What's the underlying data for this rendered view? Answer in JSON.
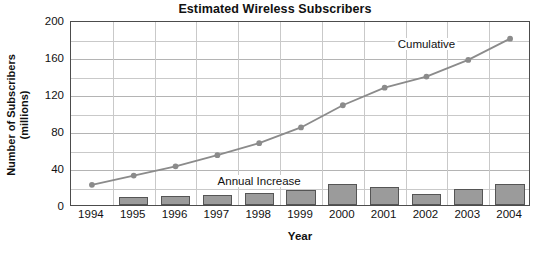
{
  "chart_data": {
    "type": "bar",
    "title": "Estimated Wireless Subscribers",
    "xlabel": "Year",
    "ylabel": "Number of Subscribers\n(millions)",
    "ylabel_line1": "Number of Subscribers",
    "ylabel_line2": "(millions)",
    "categories": [
      "1994",
      "1995",
      "1996",
      "1997",
      "1998",
      "1999",
      "2000",
      "2001",
      "2002",
      "2003",
      "2004"
    ],
    "ylim": [
      0,
      200
    ],
    "ytick_labels": [
      "0",
      "40",
      "80",
      "120",
      "160",
      "200"
    ],
    "ytick_values": [
      0,
      40,
      80,
      120,
      160,
      200
    ],
    "yminor_values": [
      20,
      60,
      100,
      140,
      180
    ],
    "grid": "horizontal-major-and-minor plus vertical at category boundaries",
    "legend": "in-plot annotations",
    "annotations": [
      {
        "text": "Cumulative",
        "series": "Cumulative",
        "x": "2002",
        "y": 176
      },
      {
        "text": "Annual Increase",
        "series": "Annual Increase",
        "x": "1998",
        "y": 28
      }
    ],
    "series": [
      {
        "name": "Annual Increase",
        "type": "bar",
        "color": "#9b9b9b",
        "edge_color": "#555555",
        "values": [
          null,
          9,
          10,
          11,
          13,
          16,
          23,
          19,
          12,
          17,
          23
        ]
      },
      {
        "name": "Cumulative",
        "type": "line",
        "color": "#8b8b8b",
        "marker": "circle",
        "values": [
          24,
          34,
          44,
          56,
          69,
          86,
          110,
          129,
          141,
          159,
          182
        ]
      }
    ]
  },
  "style": {
    "frame_color": "#4c4c4c",
    "grid_color": "#c9c9c9",
    "background": "#ffffff",
    "text_color": "#111111"
  }
}
